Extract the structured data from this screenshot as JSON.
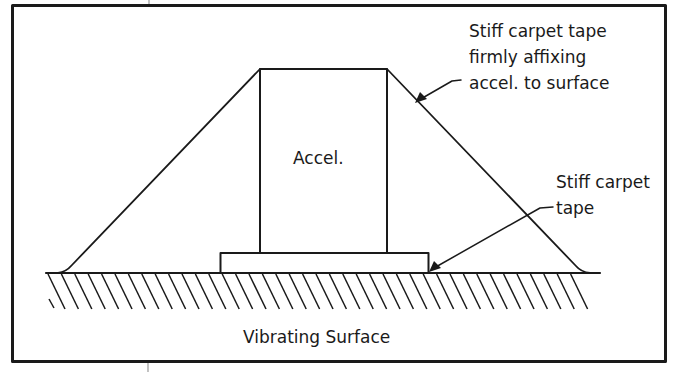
{
  "diagram": {
    "labels": {
      "accelerometer": "Accel.",
      "surface": "Vibrating Surface",
      "tape_callout_1": [
        "Stiff carpet tape",
        "firmly affixing",
        "accel. to surface"
      ],
      "tape_callout_2": [
        "Stiff carpet",
        "tape"
      ]
    },
    "components": [
      {
        "id": "accelerometer",
        "label": "Accel."
      },
      {
        "id": "base-tape",
        "label": "Stiff carpet tape"
      },
      {
        "id": "covering-tape",
        "label": "Stiff carpet tape firmly affixing accel. to surface"
      },
      {
        "id": "vibrating-surface",
        "label": "Vibrating Surface"
      }
    ],
    "colors": {
      "stroke": "#1a1a1a",
      "background": "#ffffff"
    }
  }
}
